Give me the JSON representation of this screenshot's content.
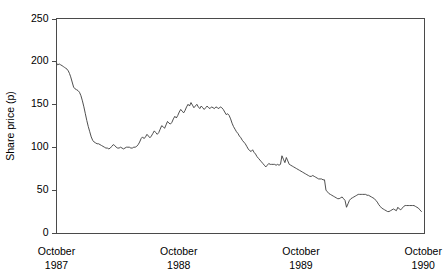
{
  "chart_data": {
    "type": "line",
    "title": "",
    "xlabel": "",
    "ylabel": "Share price (p)",
    "ylim": [
      0,
      250
    ],
    "yticks": [
      0,
      50,
      100,
      150,
      200,
      250
    ],
    "ytick_labels": [
      "0",
      "50",
      "100",
      "150",
      "200",
      "250"
    ],
    "xlim": [
      1987.79,
      1990.8
    ],
    "xticks": [
      1987.79,
      1988.79,
      1989.79,
      1990.79
    ],
    "xtick_labels": [
      {
        "month": "October",
        "year": "1987"
      },
      {
        "month": "October",
        "year": "1988"
      },
      {
        "month": "October",
        "year": "1989"
      },
      {
        "month": "October",
        "year": "1990"
      }
    ],
    "grid": false,
    "legend": null,
    "frame": [
      "left",
      "bottom",
      "top",
      "right"
    ],
    "series": [
      {
        "name": "Share price",
        "units": "p",
        "x": [
          1987.79,
          1987.8,
          1987.812,
          1987.824,
          1987.836,
          1987.846,
          1987.856,
          1987.866,
          1987.876,
          1987.886,
          1987.896,
          1987.906,
          1987.918,
          1987.93,
          1987.942,
          1987.954,
          1987.966,
          1987.978,
          1987.99,
          1988.002,
          1988.014,
          1988.026,
          1988.038,
          1988.05,
          1988.062,
          1988.074,
          1988.086,
          1988.098,
          1988.11,
          1988.122,
          1988.134,
          1988.146,
          1988.158,
          1988.17,
          1988.182,
          1988.194,
          1988.206,
          1988.218,
          1988.23,
          1988.242,
          1988.254,
          1988.266,
          1988.278,
          1988.29,
          1988.302,
          1988.314,
          1988.326,
          1988.338,
          1988.35,
          1988.362,
          1988.374,
          1988.386,
          1988.398,
          1988.41,
          1988.422,
          1988.434,
          1988.446,
          1988.458,
          1988.47,
          1988.482,
          1988.494,
          1988.506,
          1988.518,
          1988.53,
          1988.542,
          1988.554,
          1988.566,
          1988.578,
          1988.59,
          1988.602,
          1988.614,
          1988.626,
          1988.638,
          1988.65,
          1988.662,
          1988.674,
          1988.686,
          1988.698,
          1988.71,
          1988.722,
          1988.734,
          1988.746,
          1988.758,
          1988.77,
          1988.782,
          1988.794,
          1988.806,
          1988.818,
          1988.83,
          1988.842,
          1988.854,
          1988.866,
          1988.878,
          1988.89,
          1988.902,
          1988.914,
          1988.926,
          1988.938,
          1988.95,
          1988.962,
          1988.974,
          1988.986,
          1988.998,
          1989.01,
          1989.022,
          1989.034,
          1989.046,
          1989.058,
          1989.07,
          1989.082,
          1989.094,
          1989.106,
          1989.118,
          1989.13,
          1989.142,
          1989.154,
          1989.166,
          1989.178,
          1989.19,
          1989.202,
          1989.214,
          1989.226,
          1989.238,
          1989.25,
          1989.262,
          1989.274,
          1989.286,
          1989.298,
          1989.31,
          1989.322,
          1989.334,
          1989.346,
          1989.358,
          1989.37,
          1989.382,
          1989.394,
          1989.406,
          1989.418,
          1989.43,
          1989.442,
          1989.454,
          1989.466,
          1989.478,
          1989.49,
          1989.502,
          1989.514,
          1989.526,
          1989.538,
          1989.55,
          1989.562,
          1989.574,
          1989.586,
          1989.598,
          1989.61,
          1989.622,
          1989.634,
          1989.646,
          1989.658,
          1989.67,
          1989.682,
          1989.694,
          1989.706,
          1989.718,
          1989.73,
          1989.742,
          1989.754,
          1989.766,
          1989.778,
          1989.79,
          1989.802,
          1989.814,
          1989.826,
          1989.838,
          1989.85,
          1989.862,
          1989.874,
          1989.886,
          1989.898,
          1989.91,
          1989.922,
          1989.934,
          1989.946,
          1989.958,
          1989.97,
          1989.982,
          1989.994,
          1990.006,
          1990.018,
          1990.03,
          1990.042,
          1990.054,
          1990.066,
          1990.078,
          1990.09,
          1990.102,
          1990.114,
          1990.126,
          1990.138,
          1990.15,
          1990.162,
          1990.174,
          1990.186,
          1990.198,
          1990.21,
          1990.222,
          1990.234,
          1990.246,
          1990.258,
          1990.27,
          1990.282,
          1990.294,
          1990.306,
          1990.318,
          1990.33,
          1990.342,
          1990.354,
          1990.366,
          1990.378,
          1990.39,
          1990.402,
          1990.414,
          1990.426,
          1990.438,
          1990.45,
          1990.462,
          1990.474,
          1990.486,
          1990.498,
          1990.51,
          1990.522,
          1990.534,
          1990.546,
          1990.558,
          1990.57,
          1990.582,
          1990.594,
          1990.606,
          1990.618,
          1990.63,
          1990.642,
          1990.654,
          1990.666,
          1990.678,
          1990.69,
          1990.702,
          1990.714,
          1990.726,
          1990.738,
          1990.75,
          1990.762,
          1990.775
        ],
        "y": [
          198,
          196,
          197,
          196,
          195,
          194,
          193,
          192,
          191,
          189,
          186,
          182,
          176,
          170,
          168,
          167,
          166,
          164,
          160,
          154,
          147,
          139,
          131,
          124,
          118,
          112,
          108,
          106,
          105,
          104,
          104,
          103,
          102,
          101,
          100,
          99,
          99,
          98,
          99,
          101,
          103,
          102,
          100,
          99,
          99,
          100,
          99,
          98,
          99,
          100,
          100,
          100,
          99,
          99,
          100,
          100,
          101,
          103,
          106,
          110,
          112,
          110,
          112,
          115,
          113,
          111,
          113,
          116,
          119,
          117,
          115,
          117,
          121,
          125,
          124,
          122,
          126,
          130,
          128,
          127,
          129,
          133,
          136,
          134,
          137,
          141,
          144,
          142,
          140,
          143,
          147,
          150,
          148,
          152,
          149,
          146,
          148,
          150,
          147,
          145,
          148,
          146,
          144,
          146,
          148,
          146,
          145,
          147,
          146,
          145,
          147,
          146,
          145,
          147,
          146,
          144,
          141,
          138,
          139,
          137,
          133,
          128,
          124,
          121,
          118,
          116,
          113,
          111,
          108,
          106,
          104,
          101,
          98,
          96,
          95,
          97,
          94,
          92,
          89,
          87,
          85,
          83,
          81,
          79,
          77,
          79,
          81,
          80,
          80,
          80,
          80,
          79,
          80,
          79,
          80,
          90,
          86,
          82,
          88,
          84,
          80,
          79,
          78,
          77,
          76,
          75,
          74,
          73,
          72,
          71,
          70,
          69,
          68,
          67,
          66,
          66,
          67,
          66,
          65,
          64,
          63,
          63,
          63,
          62,
          62,
          50,
          48,
          46,
          45,
          44,
          43,
          42,
          41,
          40,
          40,
          41,
          42,
          40,
          38,
          30,
          34,
          38,
          40,
          41,
          42,
          43,
          44,
          45,
          45,
          45,
          45,
          45,
          45,
          44,
          44,
          43,
          42,
          41,
          40,
          38,
          36,
          33,
          31,
          29,
          28,
          27,
          26,
          25,
          25,
          26,
          27,
          28,
          27,
          26,
          30,
          28,
          27,
          29,
          31,
          32,
          32,
          32,
          32,
          32,
          32,
          32,
          31,
          30,
          29,
          27,
          25
        ]
      }
    ]
  }
}
